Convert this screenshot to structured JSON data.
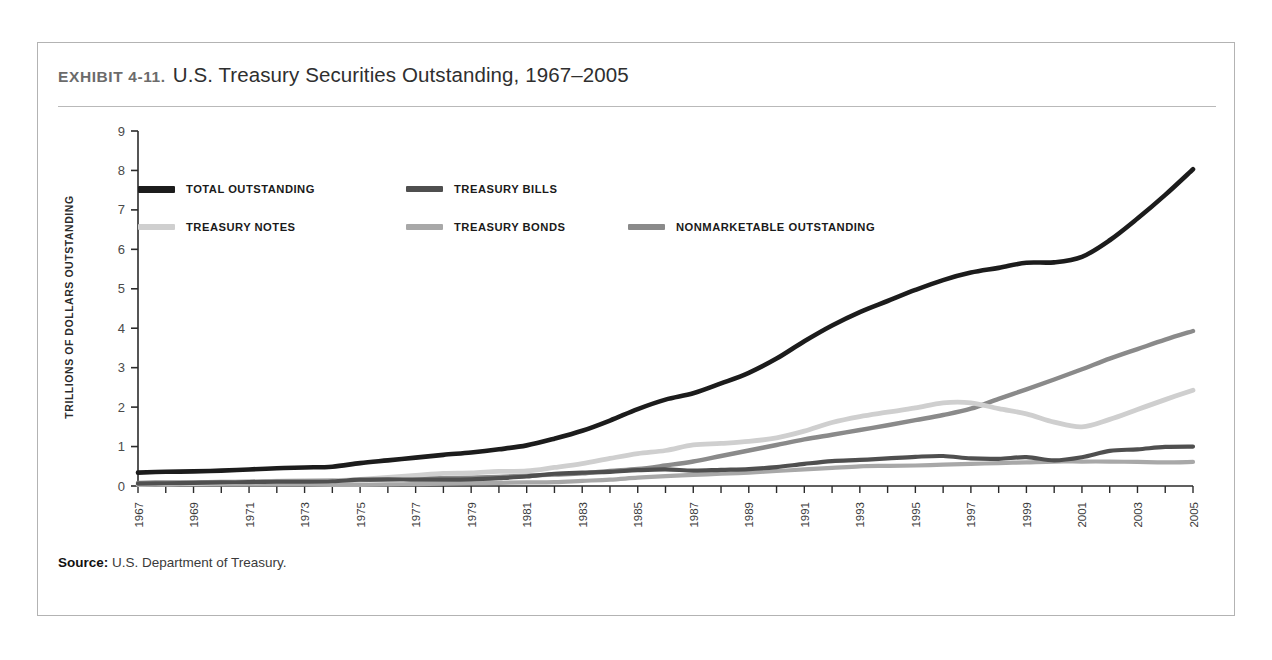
{
  "exhibit": {
    "label": "EXHIBIT 4-11.",
    "caption": "U.S. Treasury Securities Outstanding, 1967–2005"
  },
  "source": {
    "label": "Source:",
    "text": " U.S. Department of Treasury."
  },
  "legend": [
    {
      "name": "TOTAL OUTSTANDING",
      "color": "#1c1c1c"
    },
    {
      "name": "TREASURY BILLS",
      "color": "#4f4f4f"
    },
    {
      "name": "TREASURY NOTES",
      "color": "#cfcfcf"
    },
    {
      "name": "TREASURY BONDS",
      "color": "#a8a8a8"
    },
    {
      "name": "NONMARKETABLE OUTSTANDING",
      "color": "#8a8a8a"
    }
  ],
  "chart_data": {
    "type": "line",
    "title": "U.S. Treasury Securities Outstanding, 1967–2005",
    "xlabel": "YEAR",
    "ylabel": "TRILLIONS OF DOLLARS OUTSTANDING",
    "xlim": [
      1967,
      2005
    ],
    "ylim": [
      0,
      9
    ],
    "yticks": [
      0,
      1,
      2,
      3,
      4,
      5,
      6,
      7,
      8,
      9
    ],
    "ytick_labels": [
      "0",
      "1",
      "2",
      "3",
      "4",
      "5",
      "6",
      "7",
      "8",
      "9"
    ],
    "x": [
      1967,
      1968,
      1969,
      1970,
      1971,
      1972,
      1973,
      1974,
      1975,
      1976,
      1977,
      1978,
      1979,
      1980,
      1981,
      1982,
      1983,
      1984,
      1985,
      1986,
      1987,
      1988,
      1989,
      1990,
      1991,
      1992,
      1993,
      1994,
      1995,
      1996,
      1997,
      1998,
      1999,
      2000,
      2001,
      2002,
      2003,
      2004,
      2005
    ],
    "xtick_labels": [
      "1967",
      "1969",
      "1971",
      "1973",
      "1975",
      "1977",
      "1979",
      "1981",
      "1983",
      "1985",
      "1987",
      "1989",
      "1991",
      "1993",
      "1995",
      "1997",
      "1999",
      "2001",
      "2003",
      "2005"
    ],
    "grid": false,
    "legend_position": "top-left-inside",
    "series": [
      {
        "name": "TOTAL OUTSTANDING",
        "color": "#1c1c1c",
        "width": 4.6,
        "values": [
          0.34,
          0.36,
          0.37,
          0.39,
          0.42,
          0.45,
          0.47,
          0.49,
          0.58,
          0.65,
          0.72,
          0.79,
          0.85,
          0.93,
          1.03,
          1.2,
          1.4,
          1.66,
          1.95,
          2.19,
          2.35,
          2.6,
          2.87,
          3.23,
          3.67,
          4.07,
          4.41,
          4.69,
          4.97,
          5.22,
          5.41,
          5.53,
          5.66,
          5.67,
          5.81,
          6.23,
          6.78,
          7.38,
          8.03
        ]
      },
      {
        "name": "TREASURY BILLS",
        "color": "#4f4f4f",
        "width": 4.2,
        "values": [
          0.06,
          0.07,
          0.08,
          0.09,
          0.1,
          0.11,
          0.11,
          0.12,
          0.16,
          0.17,
          0.16,
          0.16,
          0.17,
          0.2,
          0.24,
          0.31,
          0.34,
          0.36,
          0.4,
          0.42,
          0.39,
          0.41,
          0.43,
          0.48,
          0.56,
          0.63,
          0.66,
          0.7,
          0.74,
          0.76,
          0.7,
          0.69,
          0.73,
          0.65,
          0.73,
          0.89,
          0.93,
          0.99,
          1.0
        ]
      },
      {
        "name": "TREASURY NOTES",
        "color": "#cfcfcf",
        "width": 4.8,
        "values": [
          0.04,
          0.05,
          0.06,
          0.08,
          0.1,
          0.12,
          0.13,
          0.13,
          0.17,
          0.22,
          0.27,
          0.32,
          0.33,
          0.37,
          0.38,
          0.47,
          0.57,
          0.7,
          0.82,
          0.9,
          1.04,
          1.08,
          1.13,
          1.22,
          1.39,
          1.61,
          1.76,
          1.87,
          1.98,
          2.11,
          2.11,
          1.96,
          1.83,
          1.62,
          1.5,
          1.69,
          1.94,
          2.19,
          2.43
        ]
      },
      {
        "name": "TREASURY BONDS",
        "color": "#a8a8a8",
        "width": 4.2,
        "values": [
          0.05,
          0.05,
          0.04,
          0.04,
          0.04,
          0.04,
          0.04,
          0.03,
          0.03,
          0.04,
          0.05,
          0.06,
          0.07,
          0.08,
          0.09,
          0.1,
          0.13,
          0.16,
          0.21,
          0.25,
          0.28,
          0.31,
          0.34,
          0.38,
          0.42,
          0.46,
          0.5,
          0.51,
          0.52,
          0.54,
          0.56,
          0.58,
          0.6,
          0.62,
          0.62,
          0.62,
          0.61,
          0.6,
          0.61
        ]
      },
      {
        "name": "NONMARKETABLE OUTSTANDING",
        "color": "#8a8a8a",
        "width": 4.4,
        "values": [
          0.08,
          0.09,
          0.09,
          0.1,
          0.11,
          0.12,
          0.13,
          0.14,
          0.15,
          0.17,
          0.19,
          0.2,
          0.21,
          0.23,
          0.26,
          0.29,
          0.32,
          0.38,
          0.43,
          0.52,
          0.62,
          0.76,
          0.9,
          1.04,
          1.18,
          1.3,
          1.42,
          1.54,
          1.67,
          1.8,
          1.96,
          2.21,
          2.45,
          2.7,
          2.96,
          3.23,
          3.47,
          3.71,
          3.93
        ]
      }
    ]
  }
}
